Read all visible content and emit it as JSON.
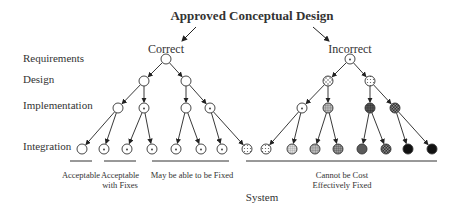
{
  "title": "Approved Conceptual Design",
  "branches": {
    "left": "Correct",
    "right": "Incorrect"
  },
  "row_labels": [
    "Requirements",
    "Design",
    "Implementation",
    "Integration"
  ],
  "categories": [
    {
      "label_lines": [
        "Acceptable"
      ]
    },
    {
      "label_lines": [
        "Acceptable",
        "with Fixes"
      ]
    },
    {
      "label_lines": [
        "May be able to be Fixed"
      ]
    },
    {
      "label_lines": [
        "Cannot be Cost",
        "Effectively Fixed"
      ]
    }
  ],
  "footer": "System",
  "integration_node_patterns": [
    "empty",
    "dot",
    "dot",
    "dot",
    "dot",
    "dot",
    "dot",
    "dots",
    "dots",
    "fine-grid",
    "grid",
    "grid-dense",
    "vertical-stripes",
    "checker-dark",
    "solid",
    "solid"
  ],
  "implementation_node_patterns": [
    "empty",
    "dot",
    "empty",
    "dot",
    "dot",
    "grid",
    "grid-dark",
    "checker-dark"
  ],
  "design_node_patterns": [
    "empty",
    "empty",
    "cross",
    "dots"
  ],
  "root_node_patterns": [
    "empty",
    "dot"
  ]
}
